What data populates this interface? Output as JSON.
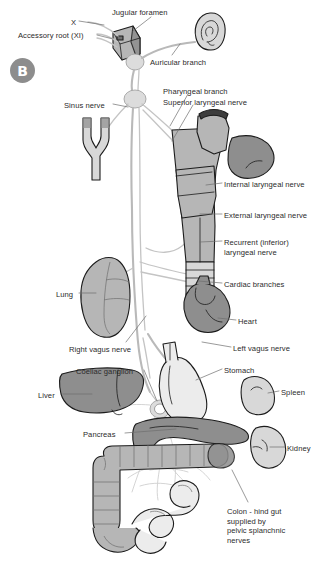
{
  "figure": {
    "panel_letter": "B",
    "background_color": "#ffffff",
    "text_color": "#2b2b2b",
    "leader_line_color": "#6e6e6e"
  },
  "palette": {
    "badge_fill": "#8d8d8d",
    "badge_text": "#ffffff",
    "nerve_light": "#d9d9d9",
    "nerve_stroke": "#9a9a9a",
    "organ_dark": "#8e8e8e",
    "organ_mid": "#b6b6b6",
    "organ_light": "#d8d8d8",
    "organ_pale": "#ececec",
    "outline": "#1c1c1c"
  },
  "labels": [
    {
      "id": "cranial-nerve-x",
      "text": "X",
      "x": 71,
      "y": 18,
      "align": "left",
      "width": 20
    },
    {
      "id": "jugular-foramen",
      "text": "Jugular foramen",
      "x": 112,
      "y": 8,
      "align": "left",
      "width": 70
    },
    {
      "id": "accessory-root-xi",
      "text": "Accessory root (XI)",
      "x": 18,
      "y": 31,
      "align": "left",
      "width": 78
    },
    {
      "id": "auricular-branch",
      "text": "Auricular branch",
      "x": 150,
      "y": 58,
      "align": "left",
      "width": 70
    },
    {
      "id": "sinus-nerve",
      "text": "Sinus nerve",
      "x": 64,
      "y": 101,
      "align": "left",
      "width": 48
    },
    {
      "id": "pharyngeal-branch",
      "text": "Pharyngeal branch",
      "x": 163,
      "y": 87,
      "align": "left",
      "width": 74
    },
    {
      "id": "superior-laryngeal-nerve",
      "text": "Superior laryngeal nerve",
      "x": 163,
      "y": 98,
      "align": "left",
      "width": 98
    },
    {
      "id": "internal-laryngeal-nerve",
      "text": "Internal laryngeal nerve",
      "x": 224,
      "y": 180,
      "align": "left",
      "width": 98
    },
    {
      "id": "external-laryngeal-nerve",
      "text": "External laryngeal nerve",
      "x": 224,
      "y": 211,
      "align": "left",
      "width": 99
    },
    {
      "id": "recurrent-laryngeal-nerve",
      "text": "Recurrent (inferior)\nlaryngeal nerve",
      "x": 224,
      "y": 238,
      "align": "left",
      "width": 92
    },
    {
      "id": "cardiac-branches",
      "text": "Cardiac branches",
      "x": 224,
      "y": 280,
      "align": "left",
      "width": 72
    },
    {
      "id": "lung",
      "text": "Lung",
      "x": 56,
      "y": 290,
      "align": "left",
      "width": 22
    },
    {
      "id": "heart",
      "text": "Heart",
      "x": 238,
      "y": 317,
      "align": "left",
      "width": 26
    },
    {
      "id": "right-vagus-nerve",
      "text": "Right vagus nerve",
      "x": 69,
      "y": 345,
      "align": "left",
      "width": 74
    },
    {
      "id": "left-vagus-nerve",
      "text": "Left vagus nerve",
      "x": 233,
      "y": 344,
      "align": "left",
      "width": 68
    },
    {
      "id": "coeliac-ganglion",
      "text": "Coeliac ganglion",
      "x": 76,
      "y": 367,
      "align": "left",
      "width": 67
    },
    {
      "id": "stomach",
      "text": "Stomach",
      "x": 224,
      "y": 366,
      "align": "left",
      "width": 37
    },
    {
      "id": "spleen",
      "text": "Spleen",
      "x": 281,
      "y": 388,
      "align": "left",
      "width": 31
    },
    {
      "id": "liver",
      "text": "Liver",
      "x": 38,
      "y": 391,
      "align": "left",
      "width": 24
    },
    {
      "id": "pancreas",
      "text": "Pancreas",
      "x": 83,
      "y": 430,
      "align": "left",
      "width": 41
    },
    {
      "id": "kidney",
      "text": "Kidney",
      "x": 287,
      "y": 444,
      "align": "left",
      "width": 32
    },
    {
      "id": "colon-hind-gut",
      "text": "Colon - hind gut\nsupplied by\npelvic splanchnic\nnerves",
      "x": 227,
      "y": 507,
      "align": "left",
      "width": 74
    }
  ],
  "structures": [
    {
      "id": "ear",
      "name": "auricle / external ear",
      "shade": "organ_light"
    },
    {
      "id": "jugular-foramen-block",
      "name": "jugular foramen bone block",
      "shade": "organ_mid"
    },
    {
      "id": "superior-ganglion",
      "name": "superior vagal ganglion",
      "shade": "nerve_light"
    },
    {
      "id": "inferior-ganglion",
      "name": "inferior vagal ganglion",
      "shade": "nerve_light"
    },
    {
      "id": "carotid-bifurcation",
      "name": "carotid artery bifurcation",
      "shade": "organ_light"
    },
    {
      "id": "pharynx",
      "name": "pharyngeal wall",
      "shade": "organ_mid"
    },
    {
      "id": "larynx",
      "name": "larynx / thyroid cartilage",
      "shade": "organ_mid"
    },
    {
      "id": "trachea",
      "name": "trachea",
      "shade": "organ_light"
    },
    {
      "id": "lung-organ",
      "name": "right lung",
      "shade": "organ_mid"
    },
    {
      "id": "heart-organ",
      "name": "heart",
      "shade": "organ_dark"
    },
    {
      "id": "liver-organ",
      "name": "liver",
      "shade": "organ_dark"
    },
    {
      "id": "stomach-organ",
      "name": "stomach",
      "shade": "organ_pale"
    },
    {
      "id": "spleen-organ",
      "name": "spleen",
      "shade": "organ_light"
    },
    {
      "id": "pancreas-organ",
      "name": "pancreas",
      "shade": "organ_dark"
    },
    {
      "id": "kidney-organ",
      "name": "kidney",
      "shade": "organ_light"
    },
    {
      "id": "colon-organ",
      "name": "colon / large intestine",
      "shade": "organ_mid"
    },
    {
      "id": "small-intestine",
      "name": "small intestine",
      "shade": "organ_pale"
    },
    {
      "id": "coeliac-ganglion-organ",
      "name": "coeliac ganglion",
      "shade": "organ_light"
    }
  ]
}
